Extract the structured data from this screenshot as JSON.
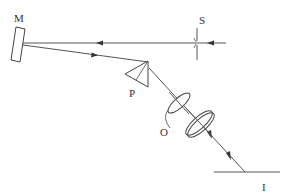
{
  "diagram": {
    "type": "optical-setup",
    "labels": {
      "mirror": "M",
      "slit": "S",
      "prism": "P",
      "objective": "O",
      "surface": "I"
    },
    "colors": {
      "line": "#444444",
      "background": "#ffffff"
    },
    "components": [
      {
        "id": "mirror",
        "label": "M",
        "description": "tilted plane mirror"
      },
      {
        "id": "slit",
        "label": "S",
        "description": "entrance slit on horizontal beam"
      },
      {
        "id": "prism",
        "label": "P",
        "description": "dispersing prism"
      },
      {
        "id": "objective",
        "label": "O",
        "description": "lens pair (objective)"
      },
      {
        "id": "surface",
        "label": "I",
        "description": "illuminated surface / sample plane"
      }
    ],
    "beams": [
      {
        "from": "right",
        "to": "mirror",
        "direction": "leftward",
        "via": "slit"
      },
      {
        "from": "mirror",
        "to": "prism",
        "direction": "right-down"
      },
      {
        "from": "prism",
        "to": "surface",
        "direction": "down-right",
        "via": "objective"
      }
    ]
  }
}
